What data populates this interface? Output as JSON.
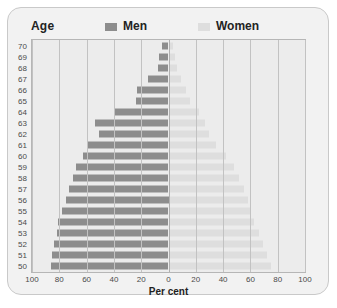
{
  "header": {
    "age_title": "Age",
    "legend": [
      {
        "label": "Men",
        "color": "#8d8d8d",
        "icon": "legend-swatch-men"
      },
      {
        "label": "Women",
        "color": "#dedede",
        "icon": "legend-swatch-women"
      }
    ]
  },
  "axis": {
    "x_title": "Per cent",
    "x_ticks": [
      "100",
      "80",
      "60",
      "40",
      "20",
      "0",
      "20",
      "40",
      "60",
      "80",
      "100"
    ],
    "y_ticks": [
      "70",
      "69",
      "68",
      "67",
      "66",
      "65",
      "64",
      "63",
      "62",
      "61",
      "60",
      "59",
      "58",
      "57",
      "56",
      "55",
      "54",
      "53",
      "52",
      "51",
      "50"
    ]
  },
  "chart_data": {
    "type": "bar",
    "title": "",
    "subtitle": "",
    "xlabel": "Per cent",
    "ylabel": "Age",
    "orientation": "horizontal",
    "style": "population-pyramid",
    "grid": true,
    "legend_position": "top",
    "xlim": [
      -100,
      100
    ],
    "x_ticks": [
      100,
      80,
      60,
      40,
      20,
      0,
      20,
      40,
      60,
      80,
      100
    ],
    "categories": [
      70,
      69,
      68,
      67,
      66,
      65,
      64,
      63,
      62,
      61,
      60,
      59,
      58,
      57,
      56,
      55,
      54,
      53,
      52,
      51,
      50
    ],
    "series": [
      {
        "name": "Men",
        "side": "left",
        "color": "#8d8d8d",
        "values": [
          5,
          7,
          8,
          15,
          23,
          24,
          40,
          54,
          51,
          59,
          63,
          68,
          70,
          73,
          75,
          78,
          81,
          82,
          84,
          85,
          86
        ]
      },
      {
        "name": "Women",
        "side": "right",
        "color": "#dedede",
        "values": [
          3,
          5,
          6,
          9,
          13,
          16,
          22,
          27,
          30,
          35,
          42,
          48,
          52,
          55,
          58,
          60,
          63,
          66,
          69,
          72,
          75
        ]
      }
    ]
  }
}
